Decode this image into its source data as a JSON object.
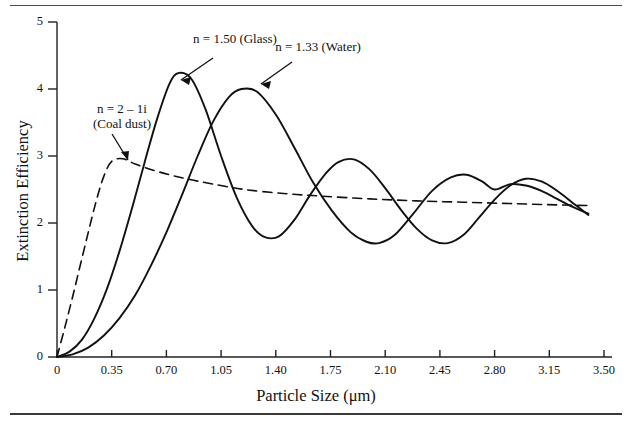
{
  "figure": {
    "x_axis_title": "Particle Size (μm)",
    "y_axis_title": "Extinction Efficiency"
  },
  "annotations": {
    "glass": "n = 1.50 (Glass)",
    "water": "n = 1.33 (Water)",
    "coal_line1": "n = 2 – 1i",
    "coal_line2": "(Coal dust)"
  },
  "chart_data": {
    "type": "line",
    "title": "",
    "xlabel": "Particle Size (μm)",
    "ylabel": "Extinction Efficiency",
    "xlim": [
      0,
      3.5
    ],
    "ylim": [
      0,
      5
    ],
    "grid": false,
    "legend": "annotations on curves",
    "xticks": [
      0,
      0.35,
      0.7,
      1.05,
      1.4,
      1.75,
      2.1,
      2.45,
      2.8,
      3.15,
      3.5
    ],
    "xtick_labels": [
      "0",
      "0.35",
      "0.70",
      "1.05",
      "1.40",
      "1.75",
      "2.10",
      "2.45",
      "2.80",
      "3.15",
      "3.50"
    ],
    "yticks": [
      0,
      1,
      2,
      3,
      4,
      5
    ],
    "ytick_labels": [
      "0",
      "1",
      "2",
      "3",
      "4",
      "5"
    ],
    "series": [
      {
        "name": "n = 1.50 (Glass)",
        "style": "solid",
        "color": "#111111",
        "x": [
          0.0,
          0.08,
          0.16,
          0.24,
          0.32,
          0.4,
          0.48,
          0.56,
          0.64,
          0.72,
          0.78,
          0.86,
          0.95,
          1.05,
          1.15,
          1.25,
          1.33,
          1.42,
          1.52,
          1.62,
          1.72,
          1.8,
          1.9,
          2.0,
          2.1,
          2.2,
          2.3,
          2.4,
          2.5,
          2.6,
          2.7,
          2.8,
          2.9,
          3.0,
          3.1,
          3.2,
          3.3,
          3.4
        ],
        "y": [
          0.0,
          0.08,
          0.26,
          0.58,
          1.02,
          1.58,
          2.22,
          2.9,
          3.55,
          4.08,
          4.24,
          4.15,
          3.7,
          3.0,
          2.38,
          1.95,
          1.79,
          1.8,
          2.05,
          2.42,
          2.74,
          2.91,
          2.95,
          2.8,
          2.52,
          2.2,
          1.92,
          1.74,
          1.7,
          1.82,
          2.08,
          2.35,
          2.56,
          2.66,
          2.62,
          2.48,
          2.3,
          2.12
        ]
      },
      {
        "name": "n = 1.33 (Water)",
        "style": "solid",
        "color": "#111111",
        "x": [
          0.0,
          0.1,
          0.2,
          0.3,
          0.4,
          0.5,
          0.6,
          0.7,
          0.8,
          0.9,
          1.0,
          1.1,
          1.18,
          1.28,
          1.4,
          1.52,
          1.64,
          1.76,
          1.88,
          1.98,
          2.06,
          2.16,
          2.28,
          2.4,
          2.52,
          2.62,
          2.72,
          2.8,
          2.9,
          3.0,
          3.1,
          3.2,
          3.3,
          3.4
        ],
        "y": [
          0.0,
          0.04,
          0.14,
          0.32,
          0.58,
          0.92,
          1.36,
          1.86,
          2.42,
          3.0,
          3.52,
          3.88,
          4.0,
          3.96,
          3.62,
          3.12,
          2.6,
          2.18,
          1.86,
          1.72,
          1.7,
          1.82,
          2.14,
          2.48,
          2.68,
          2.72,
          2.62,
          2.5,
          2.58,
          2.56,
          2.48,
          2.36,
          2.24,
          2.14
        ]
      },
      {
        "name": "n = 2 – 1i (Coal dust)",
        "style": "dashed",
        "color": "#111111",
        "x": [
          0.0,
          0.05,
          0.1,
          0.15,
          0.2,
          0.25,
          0.3,
          0.35,
          0.42,
          0.5,
          0.6,
          0.72,
          0.85,
          1.0,
          1.2,
          1.45,
          1.7,
          2.0,
          2.3,
          2.6,
          2.9,
          3.2,
          3.4
        ],
        "y": [
          0.0,
          0.44,
          0.9,
          1.38,
          1.86,
          2.32,
          2.7,
          2.92,
          2.96,
          2.88,
          2.8,
          2.72,
          2.65,
          2.58,
          2.5,
          2.44,
          2.4,
          2.36,
          2.33,
          2.31,
          2.29,
          2.27,
          2.26
        ]
      }
    ]
  }
}
